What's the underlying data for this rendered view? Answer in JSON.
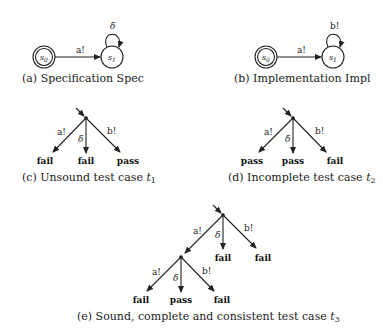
{
  "figures": {
    "a": {
      "caption": "(a) Specification Spec",
      "states": [
        "s0",
        "s1"
      ],
      "state_labels": {
        "s0": "s",
        "s0_sub": "0",
        "s1": "s",
        "s1_sub": "1"
      },
      "transition": "a!",
      "self_loop": "δ"
    },
    "b": {
      "caption": "(b) Implementation Impl",
      "state_labels": {
        "s0": "s",
        "s0_sub": "0",
        "s1": "s",
        "s1_sub": "1"
      },
      "transition": "a!",
      "self_loop": "b!"
    },
    "c": {
      "caption_prefix": "(c) Unsound test case ",
      "caption_var": "t",
      "caption_sub": "1",
      "edges": [
        "a!",
        "δ",
        "b!"
      ],
      "leaves": [
        "fail",
        "fail",
        "pass"
      ]
    },
    "d": {
      "caption_prefix": "(d) Incomplete test case ",
      "caption_var": "t",
      "caption_sub": "2",
      "edges": [
        "a!",
        "δ",
        "b!"
      ],
      "leaves": [
        "pass",
        "pass",
        "fail"
      ]
    },
    "e": {
      "caption_prefix": "(e) Sound, complete and consistent test case ",
      "caption_var": "t",
      "caption_sub": "3",
      "top_edges": [
        "a!",
        "δ",
        "b!"
      ],
      "top_leaves": [
        "fail",
        "fail"
      ],
      "bottom_edges": [
        "a!",
        "δ",
        "b!"
      ],
      "bottom_leaves": [
        "fail",
        "pass",
        "fail"
      ]
    }
  }
}
